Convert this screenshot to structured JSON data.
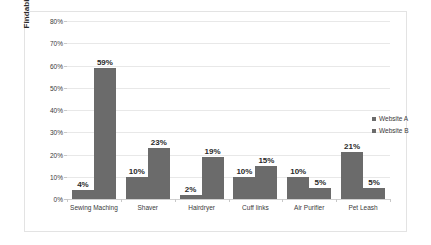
{
  "chart_data": {
    "type": "bar",
    "title": "",
    "xlabel": "",
    "ylabel": "Findability Rate",
    "ylim": [
      0,
      80
    ],
    "ytick_labels": [
      "0%",
      "10%",
      "20%",
      "30%",
      "40%",
      "50%",
      "60%",
      "70%",
      "80%"
    ],
    "ytick_values": [
      0,
      10,
      20,
      30,
      40,
      50,
      60,
      70,
      80
    ],
    "grid": true,
    "legend_position": "right",
    "categories": [
      "Sewing Maching",
      "Shaver",
      "Hairdryer",
      "Cuff links",
      "Air Purifier",
      "Pet Leash"
    ],
    "series": [
      {
        "name": "Website A",
        "color": "#6b6b6b",
        "values": [
          4,
          10,
          2,
          10,
          10,
          21
        ],
        "data_labels": [
          "4%",
          "10%",
          "2%",
          "10%",
          "10%",
          "21%"
        ]
      },
      {
        "name": "Website B",
        "color": "#6b6b6b",
        "values": [
          59,
          23,
          19,
          15,
          5,
          5
        ],
        "data_labels": [
          "59%",
          "23%",
          "19%",
          "15%",
          "5%",
          "5%"
        ]
      }
    ]
  },
  "legend": {
    "items": [
      {
        "label": "Website A"
      },
      {
        "label": "Website B"
      }
    ]
  },
  "colors": {
    "bar": "#6b6b6b",
    "gridline": "#e8e8e8",
    "border": "#e3e3e3",
    "text": "#3a3a3a"
  }
}
